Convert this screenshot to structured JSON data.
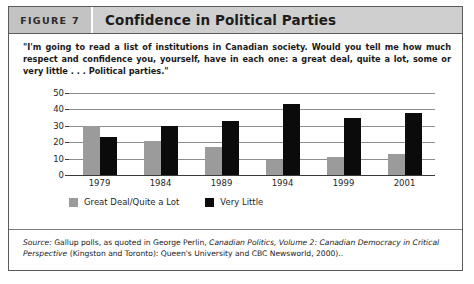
{
  "figure": {
    "number_label": "FIGURE 7",
    "title": "Confidence in Political Parties",
    "quote": "\"I'm going to read a list of institutions in Canadian society. Would you tell me how much respect and confidence you, yourself, have in each one: a great deal, quite a lot, some or very little . . . Political parties.\"",
    "source_prefix": "Source:",
    "source_text_1": " Gallup polls, as quoted in George Perlin, ",
    "source_italic_1": "Canadian Politics, Volume 2: Canadian Democracy in Critical Perspective",
    "source_text_2": " (Kingston and Toronto): Queen's University and CBC Newsworld, 2000).."
  },
  "chart_data": {
    "type": "bar",
    "title": "Confidence in Political Parties",
    "xlabel": "",
    "ylabel": "",
    "ylim": [
      0,
      50
    ],
    "yticks": [
      0,
      10,
      20,
      30,
      40,
      50
    ],
    "grid": true,
    "legend_position": "bottom-left",
    "categories": [
      "1979",
      "1984",
      "1989",
      "1994",
      "1999",
      "2001"
    ],
    "series": [
      {
        "name": "Great Deal/Quite a Lot",
        "color": "#9b9b9b",
        "values": [
          30,
          21,
          17,
          9,
          11,
          13
        ]
      },
      {
        "name": "Very Little",
        "color": "#0b0b0b",
        "values": [
          23,
          30,
          33,
          43,
          35,
          38
        ]
      }
    ]
  }
}
